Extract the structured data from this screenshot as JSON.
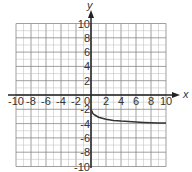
{
  "chart_data": {
    "type": "line",
    "title": "",
    "xlabel": "x",
    "ylabel": "y",
    "xlim": [
      -10,
      10
    ],
    "ylim": [
      -10,
      10
    ],
    "grid": true,
    "x_ticks": [
      -10,
      -8,
      -6,
      -4,
      -2,
      0,
      2,
      4,
      6,
      8,
      10
    ],
    "y_ticks": [
      -10,
      -8,
      -6,
      -4,
      -2,
      2,
      4,
      6,
      8,
      10
    ],
    "series": [
      {
        "name": "curve",
        "x": [
          0,
          0.25,
          0.5,
          1,
          2,
          3,
          4,
          5,
          6,
          7,
          8,
          9,
          10
        ],
        "y": [
          -2,
          -2.6,
          -2.8,
          -3.1,
          -3.4,
          -3.55,
          -3.65,
          -3.72,
          -3.78,
          -3.83,
          -3.87,
          -3.9,
          -3.93
        ]
      }
    ]
  }
}
